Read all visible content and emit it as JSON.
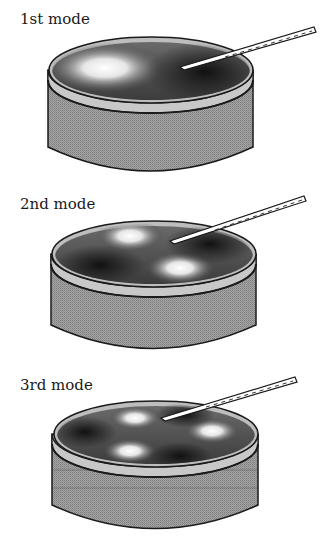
{
  "diagram": {
    "type": "vibration-modes-of-cylindrical-resonator",
    "colors": {
      "body_fill": "#9a9a9a",
      "band_fill": "#c4c4c4",
      "surface_dark": "#2a2a2a",
      "surface_highlight": "#f2f2f2",
      "outline": "#1a1a1a",
      "probe_fill": "#ffffff"
    },
    "modes": [
      {
        "label": "1st mode",
        "antinode_count": 2
      },
      {
        "label": "2nd mode",
        "antinode_count": 4
      },
      {
        "label": "3rd mode",
        "antinode_count": 6
      }
    ]
  }
}
